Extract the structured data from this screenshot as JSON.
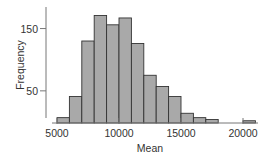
{
  "chart_data": {
    "type": "bar",
    "subtype": "histogram",
    "title": "",
    "xlabel": "Mean",
    "ylabel": "Frequency",
    "bin_width": 1000,
    "bins": [
      {
        "start": 5000,
        "end": 6000,
        "count": 7
      },
      {
        "start": 6000,
        "end": 7000,
        "count": 41
      },
      {
        "start": 7000,
        "end": 8000,
        "count": 130
      },
      {
        "start": 8000,
        "end": 9000,
        "count": 171
      },
      {
        "start": 9000,
        "end": 10000,
        "count": 156
      },
      {
        "start": 10000,
        "end": 11000,
        "count": 167
      },
      {
        "start": 11000,
        "end": 12000,
        "count": 126
      },
      {
        "start": 12000,
        "end": 13000,
        "count": 75
      },
      {
        "start": 13000,
        "end": 14000,
        "count": 57
      },
      {
        "start": 14000,
        "end": 15000,
        "count": 41
      },
      {
        "start": 15000,
        "end": 16000,
        "count": 14
      },
      {
        "start": 16000,
        "end": 17000,
        "count": 7
      },
      {
        "start": 17000,
        "end": 18000,
        "count": 4
      },
      {
        "start": 18000,
        "end": 19000,
        "count": 0
      },
      {
        "start": 19000,
        "end": 20000,
        "count": 0
      },
      {
        "start": 20000,
        "end": 21000,
        "count": 2
      }
    ],
    "x_ticks": [
      5000,
      10000,
      15000,
      20000
    ],
    "y_ticks": [
      50,
      150
    ],
    "xlim": [
      5000,
      21000
    ],
    "ylim": [
      0,
      180
    ],
    "grid": false,
    "legend": null,
    "colors": {
      "bar_fill": "#a9a9a9",
      "bar_edge": "#333333",
      "axis": "#555555",
      "text": "#333333"
    }
  }
}
